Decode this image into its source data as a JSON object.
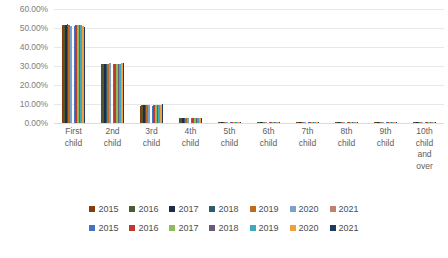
{
  "chart_data": {
    "type": "bar",
    "title": "",
    "subtitle": "",
    "xlabel": "",
    "ylabel": "",
    "ylim": [
      0,
      60
    ],
    "y_tick_labels": [
      "60.00%",
      "50.00%",
      "40.00%",
      "30.00%",
      "20.00%",
      "10.00%",
      "0.00%"
    ],
    "y_tick_values": [
      60,
      50,
      40,
      30,
      20,
      10,
      0
    ],
    "grid": true,
    "grid_axis": "y",
    "legend_position": "bottom",
    "categories": [
      "First child",
      "2nd child",
      "3rd child",
      "4th child",
      "5th child",
      "6th child",
      "7th child",
      "8th child",
      "9th child",
      "10th child and over"
    ],
    "category_lines": [
      [
        "First",
        "child"
      ],
      [
        "2nd",
        "child"
      ],
      [
        "3rd",
        "child"
      ],
      [
        "4th",
        "child"
      ],
      [
        "5th",
        "child"
      ],
      [
        "6th",
        "child"
      ],
      [
        "7th",
        "child"
      ],
      [
        "8th",
        "child"
      ],
      [
        "9th",
        "child"
      ],
      [
        "10th",
        "child",
        "and",
        "over"
      ]
    ],
    "series": [
      {
        "name": "2015",
        "group": 1,
        "color": "#843C0C",
        "values": [
          51.4,
          30.8,
          9.2,
          2.4,
          0.7,
          0.2,
          0.1,
          0.05,
          0.02,
          0.01
        ]
      },
      {
        "name": "2016",
        "group": 1,
        "color": "#4E5B31",
        "values": [
          51.6,
          30.9,
          9.3,
          2.4,
          0.7,
          0.2,
          0.1,
          0.05,
          0.02,
          0.01
        ]
      },
      {
        "name": "2017",
        "group": 1,
        "color": "#1F2C49",
        "values": [
          51.8,
          31.1,
          9.3,
          2.4,
          0.7,
          0.2,
          0.1,
          0.05,
          0.02,
          0.01
        ]
      },
      {
        "name": "2018",
        "group": 1,
        "color": "#2E5C6E",
        "values": [
          51.9,
          31.2,
          9.4,
          2.4,
          0.7,
          0.2,
          0.1,
          0.05,
          0.02,
          0.01
        ]
      },
      {
        "name": "2019",
        "group": 1,
        "color": "#BF6B1C",
        "values": [
          51.5,
          31.3,
          9.5,
          2.5,
          0.7,
          0.2,
          0.1,
          0.05,
          0.02,
          0.01
        ]
      },
      {
        "name": "2020",
        "group": 1,
        "color": "#7BA2CC",
        "values": [
          51.2,
          31.4,
          9.6,
          2.5,
          0.7,
          0.2,
          0.1,
          0.05,
          0.02,
          0.01
        ]
      },
      {
        "name": "2021",
        "group": 1,
        "color": "#C08croft",
        "values": [
          50.9,
          31.5,
          9.7,
          2.5,
          0.7,
          0.2,
          0.1,
          0.05,
          0.02,
          0.01
        ]
      },
      {
        "name": "2015",
        "group": 2,
        "color": "#4472C4",
        "values": [
          51.3,
          30.9,
          9.2,
          2.4,
          0.7,
          0.2,
          0.1,
          0.05,
          0.02,
          0.01
        ]
      },
      {
        "name": "2016",
        "group": 2,
        "color": "#C0392B",
        "values": [
          51.5,
          31.0,
          9.3,
          2.4,
          0.7,
          0.2,
          0.1,
          0.05,
          0.02,
          0.01
        ]
      },
      {
        "name": "2017",
        "group": 2,
        "color": "#8FBC5A",
        "values": [
          51.7,
          31.1,
          9.4,
          2.4,
          0.7,
          0.2,
          0.1,
          0.05,
          0.02,
          0.01
        ]
      },
      {
        "name": "2018",
        "group": 2,
        "color": "#6B5B78",
        "values": [
          51.6,
          31.2,
          9.5,
          2.5,
          0.7,
          0.2,
          0.1,
          0.05,
          0.02,
          0.01
        ]
      },
      {
        "name": "2019",
        "group": 2,
        "color": "#3FA9C4",
        "values": [
          51.4,
          31.3,
          9.6,
          2.5,
          0.7,
          0.2,
          0.1,
          0.05,
          0.02,
          0.01
        ]
      },
      {
        "name": "2020",
        "group": 2,
        "color": "#F0A03C",
        "values": [
          51.1,
          31.4,
          9.7,
          2.5,
          0.7,
          0.2,
          0.1,
          0.05,
          0.02,
          0.01
        ]
      },
      {
        "name": "2021",
        "group": 2,
        "color": "#203864",
        "values": [
          50.7,
          31.5,
          9.8,
          2.5,
          0.7,
          0.2,
          0.1,
          0.05,
          0.02,
          0.01
        ]
      }
    ]
  },
  "legend": {
    "row1": [
      {
        "label": "2015",
        "color": "#843C0C"
      },
      {
        "label": "2016",
        "color": "#4E5B31"
      },
      {
        "label": "2017",
        "color": "#1F2C49"
      },
      {
        "label": "2018",
        "color": "#2E5C6E"
      },
      {
        "label": "2019",
        "color": "#BF6B1C"
      },
      {
        "label": "2020",
        "color": "#7BA2CC"
      },
      {
        "label": "2021",
        "color": "#C0826B"
      }
    ],
    "row2": [
      {
        "label": "2015",
        "color": "#4472C4"
      },
      {
        "label": "2016",
        "color": "#C0392B"
      },
      {
        "label": "2017",
        "color": "#8FBC5A"
      },
      {
        "label": "2018",
        "color": "#6B5B78"
      },
      {
        "label": "2019",
        "color": "#3FA9C4"
      },
      {
        "label": "2020",
        "color": "#F0A03C"
      },
      {
        "label": "2021",
        "color": "#203864"
      }
    ]
  }
}
